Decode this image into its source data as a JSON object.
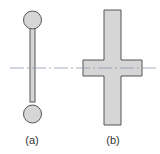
{
  "figure": {
    "colors": {
      "fill": "#d6d6d6",
      "stroke": "#555555",
      "centerline": "#8a9aa8"
    },
    "panels": [
      {
        "id": "a",
        "label": "(a)",
        "shape": "dumbbell"
      },
      {
        "id": "b",
        "label": "(b)",
        "shape": "cross"
      }
    ],
    "centerline": "dash-dot horizontal axis"
  }
}
